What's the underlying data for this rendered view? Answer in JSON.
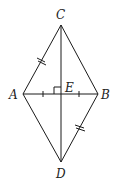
{
  "figure": {
    "type": "rhombus-with-diagonals",
    "points": {
      "C": {
        "label": "C",
        "x": 61,
        "y": 25
      },
      "A": {
        "label": "A",
        "x": 23,
        "y": 94
      },
      "B": {
        "label": "B",
        "x": 98,
        "y": 94
      },
      "D": {
        "label": "D",
        "x": 61,
        "y": 162
      },
      "E": {
        "label": "E",
        "x": 61,
        "y": 94
      }
    },
    "segments": [
      "CA",
      "CB",
      "AD",
      "BD",
      "CD",
      "AB"
    ],
    "marks": {
      "double_tick": [
        "CA",
        "BD"
      ],
      "single_tick": [
        "AE",
        "EB"
      ],
      "right_angle": "E"
    }
  }
}
